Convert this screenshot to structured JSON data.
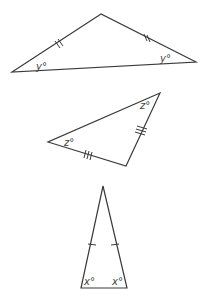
{
  "diagram": {
    "triangles": [
      {
        "id": "triangle-y",
        "vertices": [
          [
            101,
            14
          ],
          [
            12,
            72
          ],
          [
            196,
            62
          ]
        ],
        "angle_labels": [
          {
            "text": "y°",
            "x": 38,
            "y": 69
          },
          {
            "text": "y°",
            "x": 161,
            "y": 62
          }
        ],
        "tick_marks": "double"
      },
      {
        "id": "triangle-z",
        "vertices": [
          [
            160,
            93
          ],
          [
            48,
            142
          ],
          [
            126,
            166
          ]
        ],
        "angle_labels": [
          {
            "text": "z°",
            "x": 64,
            "y": 146
          },
          {
            "text": "z°",
            "x": 141,
            "y": 109
          }
        ],
        "tick_marks": "triple"
      },
      {
        "id": "triangle-x",
        "vertices": [
          [
            103,
            186
          ],
          [
            81,
            288
          ],
          [
            127,
            288
          ]
        ],
        "angle_labels": [
          {
            "text": "x°",
            "x": 83,
            "y": 285
          },
          {
            "text": "x°",
            "x": 112,
            "y": 285
          }
        ],
        "tick_marks": "single"
      }
    ],
    "stroke_color": "#3a3a3a"
  }
}
